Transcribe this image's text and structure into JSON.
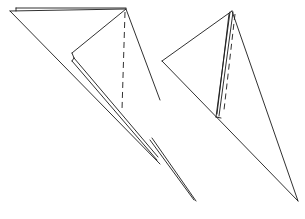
{
  "diagram": {
    "colors": {
      "line": "#1a1a1a",
      "background": "#ffffff"
    },
    "figures": [
      {
        "id": "left-figure",
        "description": "Folded triangle with inner flap and dashed fold line",
        "solid_lines": [
          [
            [
              10,
              11
            ],
            [
              126,
              9
            ]
          ],
          [
            [
              16,
              8
            ],
            [
              126,
              8
            ]
          ],
          [
            [
              16,
              8
            ],
            [
              16,
              11
            ]
          ],
          [
            [
              126,
              9
            ],
            [
              160,
              100
            ]
          ],
          [
            [
              10,
              11
            ],
            [
              160,
              164
            ]
          ],
          [
            [
              126,
              9
            ],
            [
              72,
              53
            ]
          ],
          [
            [
              72,
              53
            ],
            [
              74,
              58
            ]
          ],
          [
            [
              74,
              58
            ],
            [
              158,
              157
            ]
          ],
          [
            [
              72,
              61
            ],
            [
              157,
              160
            ]
          ],
          [
            [
              74,
              58
            ],
            [
              72,
              61
            ]
          ]
        ],
        "dashed_lines": [
          [
            [
              125,
              12
            ],
            [
              122,
              110
            ]
          ]
        ]
      },
      {
        "id": "right-figure",
        "description": "Folded triangle with narrow layered flap and dashed fold line",
        "solid_lines": [
          [
            [
              150,
              140
            ],
            [
              194,
              200
            ]
          ],
          [
            [
              152,
              138
            ],
            [
              196,
              201
            ]
          ],
          [
            [
              232,
              11
            ],
            [
              162,
              61
            ]
          ],
          [
            [
              162,
              61
            ],
            [
              298,
              201
            ]
          ],
          [
            [
              232,
              11
            ],
            [
              298,
              201
            ]
          ],
          [
            [
              230,
              12
            ],
            [
              216,
              117
            ]
          ],
          [
            [
              233,
              12
            ],
            [
              219,
              116
            ]
          ],
          [
            [
              229,
              14
            ],
            [
              217,
              114
            ]
          ],
          [
            [
              216,
              117
            ],
            [
              221,
              118
            ]
          ]
        ],
        "dashed_lines": [
          [
            [
              235,
              14
            ],
            [
              224,
              110
            ]
          ]
        ]
      }
    ],
    "caption": ""
  }
}
